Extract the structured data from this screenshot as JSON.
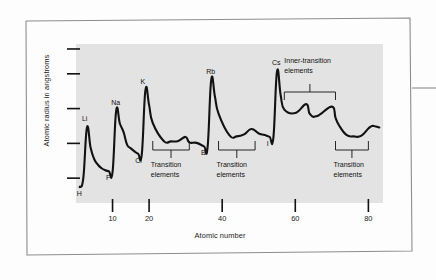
{
  "figure": {
    "background_color": "#ffffff",
    "plot_background_color": "#e3e3e3",
    "line_color": "#121212",
    "frame_color": "#8d8d90"
  },
  "chart_data": {
    "type": "line",
    "title": "",
    "xlabel": "Atomic number",
    "ylabel": "Atomic radius in angstroms",
    "xlim": [
      0,
      84
    ],
    "ylim": [
      0,
      3.2
    ],
    "grid": false,
    "legend": null,
    "xticks": [
      10,
      20,
      40,
      60,
      80
    ],
    "xtick_labels": [
      "10",
      "20",
      "40",
      "60",
      "80"
    ],
    "yticks": [
      0.5,
      1.2,
      1.9,
      2.6,
      3.1
    ],
    "ytick_labels": [
      "",
      "",
      "",
      "",
      ""
    ],
    "series": [
      {
        "name": "Atomic radius",
        "x": [
          1,
          2,
          3,
          4,
          5,
          6,
          7,
          8,
          9,
          10,
          11,
          12,
          13,
          14,
          15,
          16,
          17,
          18,
          19,
          20,
          21,
          24,
          26,
          28,
          30,
          31,
          33,
          35,
          36,
          37,
          38,
          39,
          42,
          44,
          46,
          48,
          50,
          52,
          53,
          54,
          55,
          56,
          57,
          60,
          63,
          64,
          66,
          70,
          71,
          72,
          74,
          76,
          78,
          80,
          81,
          82,
          83
        ],
        "y": [
          0.32,
          0.5,
          1.52,
          1.11,
          0.88,
          0.77,
          0.7,
          0.66,
          0.64,
          0.62,
          1.86,
          1.6,
          1.43,
          1.17,
          1.1,
          1.04,
          0.99,
          0.98,
          2.27,
          1.97,
          1.61,
          1.25,
          1.24,
          1.25,
          1.33,
          1.22,
          1.21,
          1.14,
          1.12,
          2.48,
          2.15,
          1.8,
          1.36,
          1.34,
          1.38,
          1.49,
          1.4,
          1.36,
          1.33,
          1.31,
          2.65,
          2.17,
          1.88,
          1.81,
          1.99,
          1.79,
          1.75,
          1.94,
          1.72,
          1.56,
          1.37,
          1.34,
          1.35,
          1.5,
          1.55,
          1.54,
          1.52
        ]
      }
    ],
    "point_labels": [
      {
        "text": "H",
        "x": 1,
        "y": 0.32
      },
      {
        "text": "Li",
        "x": 3,
        "y": 1.52
      },
      {
        "text": "F",
        "x": 9,
        "y": 0.64
      },
      {
        "text": "Na",
        "x": 11,
        "y": 1.86
      },
      {
        "text": "Cl",
        "x": 17,
        "y": 0.99
      },
      {
        "text": "K",
        "x": 19,
        "y": 2.27
      },
      {
        "text": "Br",
        "x": 35,
        "y": 1.14
      },
      {
        "text": "Rb",
        "x": 37,
        "y": 2.48
      },
      {
        "text": "I",
        "x": 53,
        "y": 1.33
      },
      {
        "text": "Cs",
        "x": 55,
        "y": 2.65
      }
    ],
    "annotations": [
      {
        "text": "Transition\nelements",
        "line1": "Transition",
        "line2": "elements",
        "bracket_from_x": 21,
        "bracket_to_x": 31
      },
      {
        "text": "Transition\nelements",
        "line1": "Transition",
        "line2": "elements",
        "bracket_from_x": 39,
        "bracket_to_x": 49
      },
      {
        "text": "Inner-transition\nelements",
        "line1": "Inner-transition",
        "line2": "elements",
        "bracket_from_x": 57,
        "bracket_to_x": 71
      },
      {
        "text": "Transition\nelements",
        "line1": "Transition",
        "line2": "elements",
        "bracket_from_x": 71,
        "bracket_to_x": 80
      }
    ]
  }
}
